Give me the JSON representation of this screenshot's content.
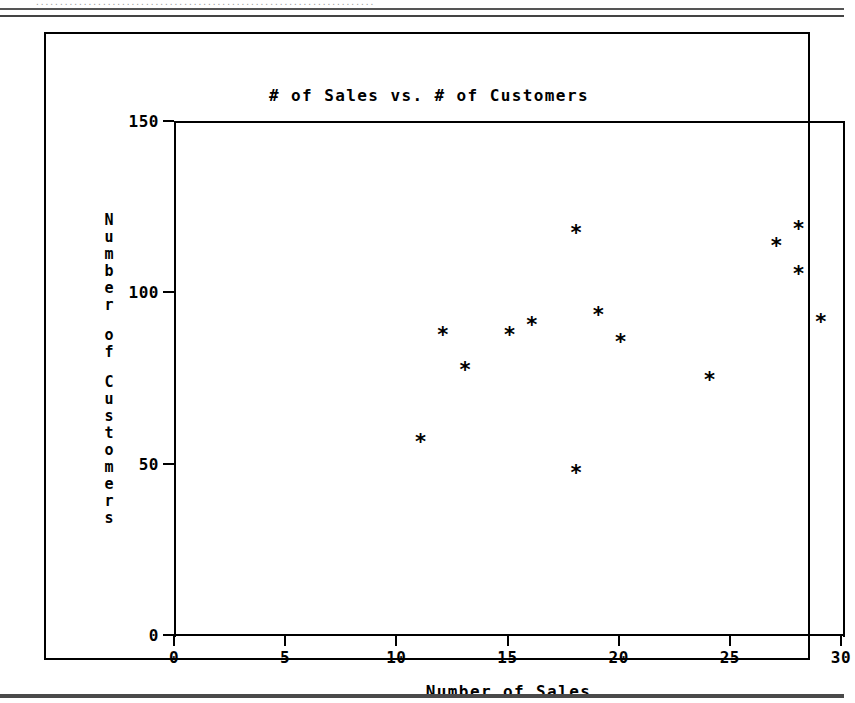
{
  "page": {
    "scan_header_text": "......................................................................."
  },
  "chart_data": {
    "type": "scatter",
    "title": "# of Sales vs. # of Customers",
    "xlabel": "Number of Sales",
    "ylabel": "Number of Customers",
    "xlim": [
      0,
      30
    ],
    "ylim": [
      0,
      150
    ],
    "xticks": [
      0,
      5,
      10,
      15,
      20,
      25,
      30
    ],
    "yticks": [
      0,
      50,
      100,
      150
    ],
    "xticklabels": [
      "0",
      "5",
      "10",
      "15",
      "20",
      "25",
      "30"
    ],
    "yticklabels": [
      "0",
      "50",
      "100",
      "150"
    ],
    "grid": false,
    "legend": null,
    "marker": "*",
    "marker_color": "#000000",
    "points": [
      {
        "x": 11,
        "y": 57
      },
      {
        "x": 12,
        "y": 88
      },
      {
        "x": 13,
        "y": 78
      },
      {
        "x": 15,
        "y": 88
      },
      {
        "x": 16,
        "y": 91
      },
      {
        "x": 18,
        "y": 118
      },
      {
        "x": 18,
        "y": 48
      },
      {
        "x": 19,
        "y": 94
      },
      {
        "x": 20,
        "y": 86
      },
      {
        "x": 24,
        "y": 75
      },
      {
        "x": 27,
        "y": 114
      },
      {
        "x": 28,
        "y": 119
      },
      {
        "x": 28,
        "y": 106
      },
      {
        "x": 29,
        "y": 92
      }
    ]
  }
}
